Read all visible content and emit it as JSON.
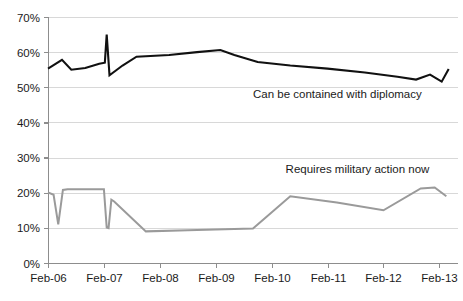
{
  "chart_data": {
    "type": "line",
    "title": "",
    "subtitle": "",
    "xlabel": "",
    "ylabel": "",
    "ylim": [
      0,
      70
    ],
    "y_ticks": [
      0,
      10,
      20,
      30,
      40,
      50,
      60,
      70
    ],
    "y_tick_labels": [
      "0%",
      "10%",
      "20%",
      "30%",
      "40%",
      "50%",
      "60%",
      "70%"
    ],
    "x_tick_labels": [
      "Feb-06",
      "Feb-07",
      "Feb-08",
      "Feb-09",
      "Feb-10",
      "Feb-11",
      "Feb-12",
      "Feb-13"
    ],
    "x_tick_values": [
      0,
      12,
      24,
      36,
      48,
      60,
      72,
      84
    ],
    "xlim": [
      0,
      88
    ],
    "grid": true,
    "grid_axis": "y",
    "legend": "inline-annotations",
    "series": [
      {
        "name": "Can be contained with diplomacy",
        "color": "#111111",
        "width": 2.1,
        "annotation": {
          "text": "Can be contained with diplomacy",
          "x": 44,
          "y": 47
        },
        "x": [
          0,
          3,
          5,
          8,
          11,
          12.2,
          12.6,
          13.2,
          16,
          19,
          26,
          32,
          37,
          40,
          45,
          52,
          60,
          68,
          75,
          79,
          82,
          84.5,
          86
        ],
        "values": [
          55.3,
          57.8,
          55.0,
          55.5,
          56.7,
          57.0,
          65.0,
          53.4,
          56.2,
          58.7,
          59.2,
          60.0,
          60.6,
          59.2,
          57.2,
          56.2,
          55.3,
          54.2,
          53.0,
          52.2,
          53.6,
          51.6,
          55.2
        ]
      },
      {
        "name": "Requires military action now",
        "color": "#9a9a9a",
        "width": 2.0,
        "annotation": {
          "text": "Requires military action now",
          "x": 51,
          "y": 25.5
        },
        "x": [
          0,
          1.2,
          2.2,
          3.2,
          4.2,
          5.0,
          12.0,
          12.6,
          13.0,
          13.6,
          14.2,
          21.0,
          30.0,
          38.0,
          44.0,
          52.0,
          62.0,
          72.0,
          80.0,
          83.0,
          85.5
        ],
        "values": [
          20.1,
          19.4,
          11.0,
          20.8,
          21.0,
          21.0,
          21.0,
          10.1,
          9.9,
          18.0,
          17.5,
          9.0,
          9.3,
          9.6,
          9.8,
          19.0,
          17.2,
          15.0,
          21.2,
          21.5,
          19.0
        ]
      }
    ]
  },
  "meta": {
    "background_color": "#ffffff",
    "grid_color": "#d8d8d8",
    "axis_color": "#8d8d8d",
    "text_color": "#1a1a1a"
  }
}
